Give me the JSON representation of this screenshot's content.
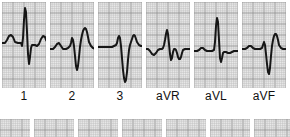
{
  "figure": {
    "name": "12-lead-ecg-limb-leads",
    "width": 290,
    "height": 137
  },
  "style": {
    "paper_background": "#e9e9e9",
    "grid_fine_color": "#b9b9b9",
    "grid_bold_color": "#8f8f8f",
    "trace_color": "#161616",
    "page_background": "#ffffff",
    "label_color": "#111111",
    "grid_fine_step_px": 2.2,
    "grid_bold_every": 5,
    "trace_width_px": 2.0
  },
  "primary_row": {
    "name": "limb-leads-row",
    "top": 2,
    "height": 86,
    "panels": [
      {
        "label": "1",
        "lead_code": "I",
        "x": 2,
        "width": 44,
        "baseline": 40,
        "label_center": 24,
        "morphology": "small upright P, tall narrow R with small q and S, upright T",
        "points": "0,41 3,41 5,38 7,34 9,33 11,35 13,40 16,41 19,41 20,44 21,36 22,18 23,6 24,10 25,30 26,52 27,62 28,55 29,46 30,43 31,43 33,43 35,44 37,42 39,37 41,34 43,35 44,38 46,41"
      },
      {
        "label": "2",
        "lead_code": "II",
        "x": 50,
        "width": 44,
        "baseline": 46,
        "label_center": 72,
        "morphology": "low P, small r then deep S wave, tall broad T wave",
        "points": "0,47 3,47 5,45 7,42 9,41 11,44 13,47 16,47 18,46 20,44 21,41 22,36 23,38 24,44 25,54 26,64 27,68 28,64 29,55 30,45 31,38 32,33 33,29 34,27 35,26 36,27 37,30 38,35 39,40 41,44 43,46 46,47"
      },
      {
        "label": "3",
        "lead_code": "III",
        "x": 98,
        "width": 44,
        "baseline": 44,
        "label_center": 120,
        "morphology": "flat baseline, very deep prolonged S wave, upright rounded T",
        "points": "0,45 4,45 8,45 11,45 14,45 16,44 18,43 19,41 20,36 21,34 22,36 23,44 24,56 25,68 26,76 27,80 28,78 29,70 30,58 31,48 32,43 33,40 34,37 35,34 36,33 37,34 38,37 39,40 41,43 43,44 46,44"
      },
      {
        "label": "aVR",
        "lead_code": "aVR",
        "x": 146,
        "width": 44,
        "baseline": 46,
        "label_center": 168,
        "morphology": "negative P, upright R spike with deep S, inverted T",
        "points": "0,47 2,47 4,49 6,52 8,53 10,51 12,48 14,47 16,47 17,46 18,43 19,38 20,32 21,28 22,32 23,42 24,52 25,58 26,56 27,50 28,47 29,47 30,48 31,51 32,55 33,57 34,57 35,55 36,51 37,48 39,47 42,47 46,47"
      },
      {
        "label": "aVL",
        "lead_code": "aVL",
        "x": 194,
        "width": 44,
        "baseline": 48,
        "label_center": 216,
        "morphology": "flat isoelectric baseline with tall narrow R wave and small S",
        "points": "0,49 3,49 5,48 7,46 9,46 11,48 13,49 16,49 18,49 20,48 21,40 22,24 23,16 24,20 25,38 26,56 27,60 28,56 29,51 30,50 32,50 34,51 36,51 38,50 40,49 43,49 46,49"
      },
      {
        "label": "aVF",
        "lead_code": "aVF",
        "x": 242,
        "width": 44,
        "baseline": 46,
        "label_center": 264,
        "morphology": "low P, small r with deep narrow S, tall broad T wave",
        "points": "0,47 3,47 5,46 7,44 9,44 11,46 13,47 16,47 18,47 20,46 21,43 22,40 23,43 24,52 25,62 26,70 27,72 28,66 29,54 30,44 31,38 32,34 33,32 34,32 35,34 36,38 37,43 39,46 41,47 43,47 46,47"
      }
    ]
  },
  "secondary_row": {
    "name": "chest-leads-row-cropped",
    "top": 119,
    "height": 18,
    "note": "bottom row of panels cropped by image edge; only blank graph paper visible",
    "panels": [
      {
        "x": 0,
        "width": 30
      },
      {
        "x": 34,
        "width": 40
      },
      {
        "x": 78,
        "width": 40
      },
      {
        "x": 122,
        "width": 40
      },
      {
        "x": 166,
        "width": 40
      },
      {
        "x": 210,
        "width": 40
      },
      {
        "x": 254,
        "width": 36
      }
    ]
  }
}
